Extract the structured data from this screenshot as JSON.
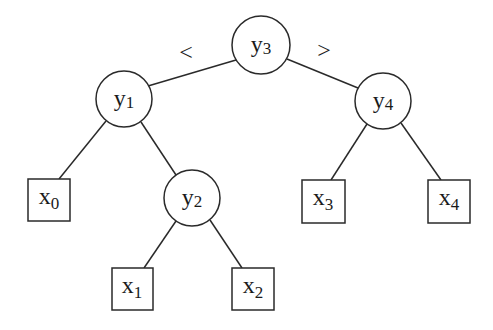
{
  "diagram": {
    "type": "binary-search-tree",
    "comparison_labels": {
      "left": "<",
      "right": ">"
    },
    "internal_nodes": [
      {
        "id": "y3",
        "base": "y",
        "sub": "3",
        "cx": 261,
        "cy": 45,
        "r": 29
      },
      {
        "id": "y1",
        "base": "y",
        "sub": "1",
        "cx": 124,
        "cy": 99,
        "r": 28
      },
      {
        "id": "y4",
        "base": "y",
        "sub": "4",
        "cx": 383,
        "cy": 101,
        "r": 28
      },
      {
        "id": "y2",
        "base": "y",
        "sub": "2",
        "cx": 192,
        "cy": 198,
        "r": 28
      }
    ],
    "leaf_nodes": [
      {
        "id": "x0",
        "base": "x",
        "sub": "0",
        "x": 28,
        "y": 179,
        "w": 42,
        "h": 42
      },
      {
        "id": "x1",
        "base": "x",
        "sub": "1",
        "x": 112,
        "y": 268,
        "w": 41,
        "h": 42
      },
      {
        "id": "x2",
        "base": "x",
        "sub": "2",
        "x": 232,
        "y": 268,
        "w": 42,
        "h": 42
      },
      {
        "id": "x3",
        "base": "x",
        "sub": "3",
        "x": 302,
        "y": 180,
        "w": 43,
        "h": 43
      },
      {
        "id": "x4",
        "base": "x",
        "sub": "4",
        "x": 428,
        "y": 180,
        "w": 42,
        "h": 43
      }
    ],
    "edges": [
      {
        "from": "y3",
        "to": "y1"
      },
      {
        "from": "y3",
        "to": "y4"
      },
      {
        "from": "y1",
        "to": "x0"
      },
      {
        "from": "y1",
        "to": "y2"
      },
      {
        "from": "y2",
        "to": "x1"
      },
      {
        "from": "y2",
        "to": "x2"
      },
      {
        "from": "y4",
        "to": "x3"
      },
      {
        "from": "y4",
        "to": "x4"
      }
    ]
  }
}
